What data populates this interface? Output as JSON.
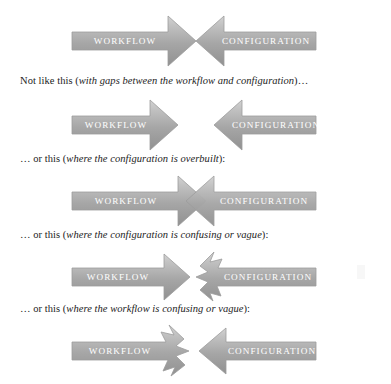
{
  "document": {
    "kind": "instructional-illustration",
    "theme": {
      "arrow_fill_light": "#c9c9c9",
      "arrow_fill_mid": "#a9a9a9",
      "arrow_fill_dark": "#8e8e8e",
      "arrow_stroke": "#9a9a9a",
      "arrow_label_color": "#ffffff",
      "caption_color": "#232323",
      "background": "#ffffff"
    }
  },
  "labels": {
    "workflow": "WORKFLOW",
    "configuration": "CONFIGURATION"
  },
  "diagrams": [
    {
      "id": "ideal",
      "name": "interlocking-arrows-ideal",
      "caption": null,
      "left_label": "WORKFLOW",
      "right_label": "CONFIGURATION",
      "relationship": "arrowheads meet point to point"
    },
    {
      "id": "gaps",
      "name": "arrows-with-gap",
      "caption": {
        "lead": "Not like this (",
        "emphasis": "with gaps between the workflow and configuration",
        "trail": ")…"
      },
      "left_label": "WORKFLOW",
      "right_label": "CONFIGURATION",
      "relationship": "gap between the two arrowheads"
    },
    {
      "id": "overbuilt",
      "name": "arrows-overlapping-overbuilt",
      "caption": {
        "lead": "… or this (",
        "emphasis": "where the configuration is overbuilt",
        "trail": "):"
      },
      "left_label": "WORKFLOW",
      "right_label": "CONFIGURATION",
      "relationship": "arrowheads overshoot and cross each other"
    },
    {
      "id": "vague-configuration",
      "name": "arrows-vague-configuration",
      "caption": {
        "lead": "… or this (",
        "emphasis": "where the configuration is confusing or vague",
        "trail": "):"
      },
      "left_label": "WORKFLOW",
      "right_label": "CONFIGURATION",
      "relationship": "configuration arrowhead is jagged and ill-defined"
    },
    {
      "id": "vague-workflow",
      "name": "arrows-vague-workflow",
      "caption": {
        "lead": "… or this (",
        "emphasis": "where the workflow is confusing or vague",
        "trail": "):"
      },
      "left_label": "WORKFLOW",
      "right_label": "CONFIGURATION",
      "relationship": "workflow arrowhead is jagged and ill-defined"
    }
  ]
}
